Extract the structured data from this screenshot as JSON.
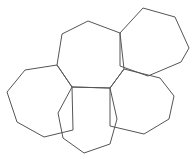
{
  "figure": {
    "background_color": "#ffffff",
    "stroke_color": "#555555",
    "stroke_width": 1,
    "fill": "none",
    "width": 193,
    "height": 160
  },
  "chart_data": {
    "type": "diagram",
    "subtype": "polygon-arrangement",
    "shape_count": 5,
    "sides_per_shape": 7,
    "grid": false,
    "legend": false,
    "axis_labels": [],
    "tick_labels": [],
    "annotations": [],
    "junction_vertices": [
      {
        "name": "left-hub",
        "x": 72,
        "y": 87
      },
      {
        "name": "right-hub",
        "x": 110,
        "y": 88
      }
    ],
    "shapes": [
      {
        "name": "top-center-heptagon",
        "sides": 7,
        "points": [
          [
            88,
            21
          ],
          [
            120,
            33
          ],
          [
            124,
            69
          ],
          [
            110,
            88
          ],
          [
            72,
            87
          ],
          [
            57,
            65
          ],
          [
            62,
            34
          ]
        ]
      },
      {
        "name": "upper-right-heptagon",
        "sides": 7,
        "points": [
          [
            143,
            8
          ],
          [
            175,
            17
          ],
          [
            189,
            48
          ],
          [
            181,
            62
          ],
          [
            148,
            76
          ],
          [
            120,
            66
          ],
          [
            120,
            33
          ]
        ]
      },
      {
        "name": "left-heptagon",
        "sides": 7,
        "points": [
          [
            57,
            65
          ],
          [
            72,
            87
          ],
          [
            73,
            130
          ],
          [
            44,
            137
          ],
          [
            17,
            122
          ],
          [
            7,
            92
          ],
          [
            25,
            70
          ]
        ]
      },
      {
        "name": "bottom-center-heptagon",
        "sides": 7,
        "points": [
          [
            72,
            87
          ],
          [
            110,
            88
          ],
          [
            117,
            119
          ],
          [
            110,
            144
          ],
          [
            84,
            153
          ],
          [
            63,
            138
          ],
          [
            58,
            113
          ]
        ]
      },
      {
        "name": "right-heptagon",
        "sides": 7,
        "points": [
          [
            124,
            69
          ],
          [
            160,
            78
          ],
          [
            174,
            96
          ],
          [
            169,
            119
          ],
          [
            144,
            134
          ],
          [
            110,
            126
          ],
          [
            110,
            88
          ]
        ]
      }
    ]
  }
}
